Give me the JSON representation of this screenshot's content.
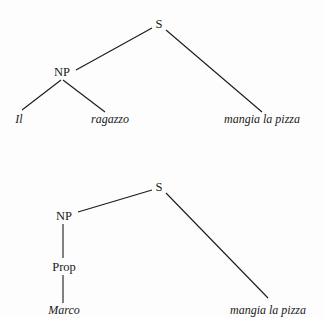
{
  "figure": {
    "type": "syntax-tree-diagram",
    "background_color": "#fdfdfd",
    "line_color": "#1a1a1a",
    "text_color": "#1a1a1a"
  },
  "trees": [
    {
      "id": "tree-1",
      "nodes": {
        "s": "S",
        "np": "NP",
        "det": "Il",
        "noun": "ragazzo",
        "vp": "mangia la pizza"
      }
    },
    {
      "id": "tree-2",
      "nodes": {
        "s": "S",
        "np": "NP",
        "prop": "Prop",
        "name": "Marco",
        "vp": "mangia la pizza"
      }
    }
  ]
}
